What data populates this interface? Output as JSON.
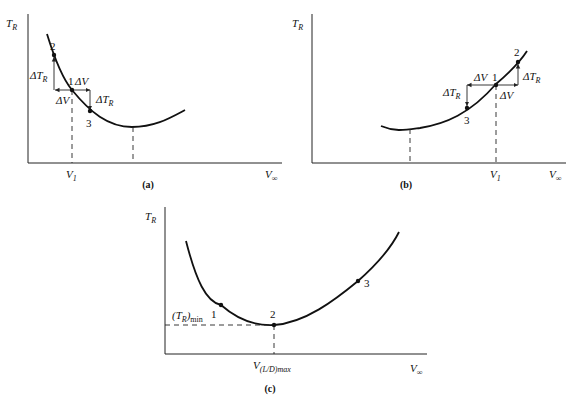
{
  "panels": [
    {
      "id": "a",
      "caption": "(a)",
      "y_axis_label": "T",
      "y_axis_sub": "R",
      "x_axis_label": "V",
      "x_axis_sub": "∞",
      "x_tick_label": "V",
      "x_tick_sub": "1",
      "points": [
        "1",
        "2",
        "3"
      ],
      "delta_v_label": "ΔV",
      "delta_tr_label": "ΔT",
      "delta_tr_sub": "R",
      "description": "Left-hand side of thrust-required curve (V1 below minimum-thrust velocity)"
    },
    {
      "id": "b",
      "caption": "(b)",
      "y_axis_label": "T",
      "y_axis_sub": "R",
      "x_axis_label": "V",
      "x_axis_sub": "∞",
      "x_tick_label": "V",
      "x_tick_sub": "1",
      "points": [
        "1",
        "2",
        "3"
      ],
      "delta_v_label": "ΔV",
      "delta_tr_label": "ΔT",
      "delta_tr_sub": "R",
      "description": "Right-hand side of thrust-required curve (V1 above minimum-thrust velocity)"
    },
    {
      "id": "c",
      "caption": "(c)",
      "y_axis_label": "T",
      "y_axis_sub": "R",
      "x_axis_label": "V",
      "x_axis_sub": "∞",
      "min_label": "(T",
      "min_label_sub1": "R",
      "min_label_close": ")",
      "min_label_sub2": "min",
      "x_tick_label": "V",
      "x_tick_sub": "(L/D)max",
      "points": [
        "1",
        "2",
        "3"
      ],
      "description": "Minimum thrust required at V(L/D)max"
    }
  ]
}
